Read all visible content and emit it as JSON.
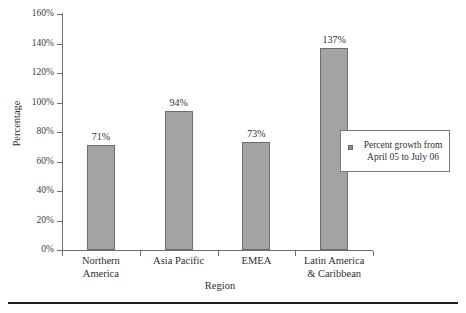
{
  "chart_data": {
    "type": "bar",
    "title": "",
    "xlabel": "Region",
    "ylabel": "Percentage",
    "categories": [
      "Northern America",
      "Asia Pacific",
      "EMEA",
      "Latin America & Caribbean"
    ],
    "category_lines": [
      [
        "Northern",
        "America"
      ],
      [
        "Asia Pacific",
        ""
      ],
      [
        "EMEA",
        ""
      ],
      [
        "Latin America",
        "& Caribbean"
      ]
    ],
    "values": [
      71,
      94,
      73,
      137
    ],
    "value_labels": [
      "71%",
      "94%",
      "73%",
      "137%"
    ],
    "ylim": [
      0,
      160
    ],
    "ytick_values": [
      0,
      20,
      40,
      60,
      80,
      100,
      120,
      140,
      160
    ],
    "ytick_labels": [
      "0%",
      "20%",
      "40%",
      "60%",
      "80%",
      "100%",
      "120%",
      "140%",
      "160%"
    ],
    "grid": false,
    "legend_position": "right-middle",
    "series": [
      {
        "name": "Percent growth from April 05 to July 06",
        "values": [
          71,
          94,
          73,
          137
        ],
        "color": "#a3a3a3"
      }
    ],
    "colors": {
      "bar_fill": "#a3a3a3",
      "bar_edge": "#6d6d6d",
      "axis": "#6e6e6e",
      "text": "#2f2f2f",
      "background": "#ffffff",
      "rule": "#1d1d1d"
    }
  },
  "legend": {
    "line1": "Percent growth from",
    "line2": "April 05 to July 06",
    "marker": "square-marker"
  },
  "axes": {
    "x_title": "Region",
    "y_title": "Percentage"
  }
}
